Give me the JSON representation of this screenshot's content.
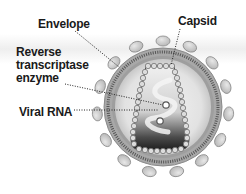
{
  "diagram": {
    "labels": {
      "envelope": "Envelope",
      "capsid": "Capsid",
      "reverse_transcriptase_line1": "Reverse",
      "reverse_transcriptase_line2": "transcriptase",
      "reverse_transcriptase_line3": "enzyme",
      "viral_rna": "Viral RNA"
    },
    "colors": {
      "background": "#ffffff",
      "knob_fill": "#c9c9c9",
      "knob_stroke": "#8a8a8a",
      "membrane": "#9a9a9a",
      "inner_fill": "#e6e6e6",
      "capsid_dark": "#2a2a2a",
      "capsid_bead": "#d8d8d8",
      "leader_line": "#222222",
      "text": "#1a1a1a"
    }
  }
}
